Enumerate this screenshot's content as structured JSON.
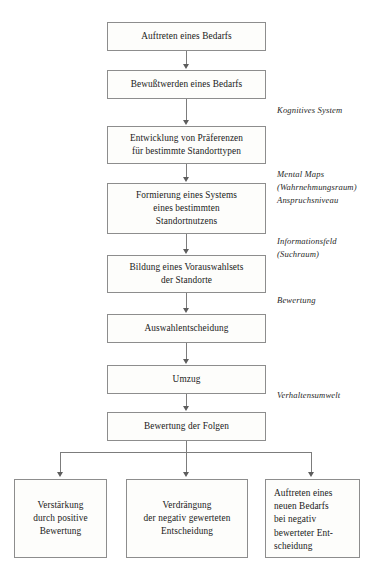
{
  "diagram": {
    "type": "flowchart",
    "language": "de",
    "colors": {
      "background": "#ffffff",
      "box_fill": "#fdfdfb",
      "box_border": "#8d8d8d",
      "connector": "#7c7c7c",
      "text": "#1a1a1a"
    },
    "main_chain": [
      {
        "id": "auftreten-bedarfs",
        "label": "Auftreten eines Bedarfs"
      },
      {
        "id": "bewusstwerden-bedarfs",
        "label": "Bewußtwerden eines Bedarfs"
      },
      {
        "id": "entwicklung-praeferenzen",
        "label": "Entwicklung von Präferenzen\nfür bestimmte Standorttypen"
      },
      {
        "id": "formierung-system",
        "label": "Formierung eines Systems\neines bestimmten\nStandortnutzens"
      },
      {
        "id": "bildung-vorauswahlset",
        "label": "Bildung eines Vorauswahlsets\nder Standorte"
      },
      {
        "id": "auswahlentscheidung",
        "label": "Auswahlentscheidung"
      },
      {
        "id": "umzug",
        "label": "Umzug"
      },
      {
        "id": "bewertung-folgen",
        "label": "Bewertung der Folgen"
      }
    ],
    "outcomes": [
      {
        "id": "verstaerkung",
        "label": "Verstärkung\ndurch positive\nBewertung"
      },
      {
        "id": "verdraengung",
        "label": "Verdrängung\nder negativ gewerteten\nEntscheidung"
      },
      {
        "id": "auftreten-neuer-bedarf",
        "label": "Auftreten eines\nneuen Bedarfs\nbei negativ\nbewerteter Ent-\nscheidung"
      }
    ],
    "annotations": [
      {
        "id": "kognitives-system",
        "label": "Kognitives System"
      },
      {
        "id": "mental-maps",
        "label": "Mental Maps\n(Wahrnehmungsraum)\nAnspruchsniveau"
      },
      {
        "id": "informationsfeld",
        "label": "Informationsfeld\n(Suchraum)"
      },
      {
        "id": "bewertung",
        "label": "Bewertung"
      },
      {
        "id": "verhaltensumwelt",
        "label": "Verhaltensumwelt"
      }
    ]
  }
}
